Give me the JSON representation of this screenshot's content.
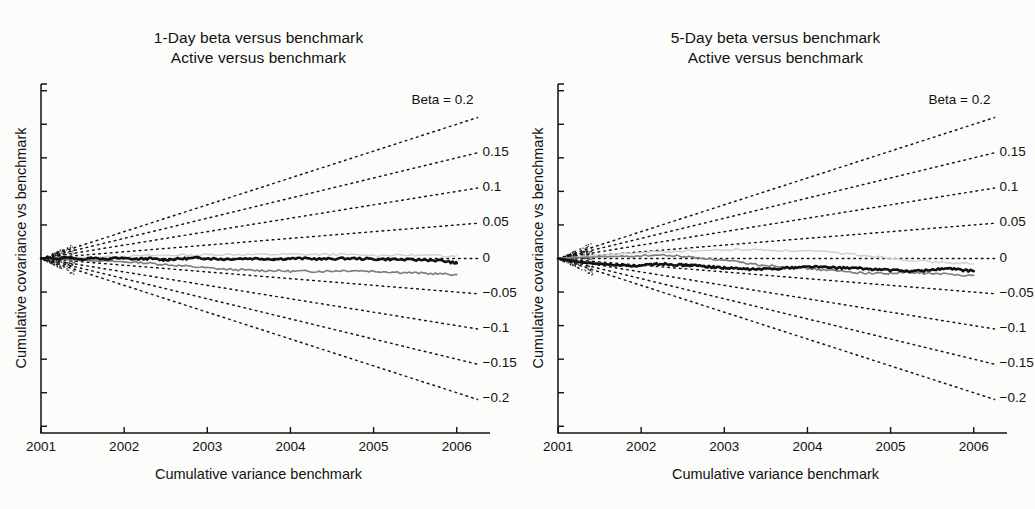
{
  "figure": {
    "background": "#fcfcfa",
    "ink": "#111111"
  },
  "panels": [
    {
      "id": "panel-1day",
      "title_line1": "1-Day beta versus benchmark",
      "title_line2": "Active versus benchmark",
      "ylabel": "Cumulative covariance vs benchmark",
      "xlabel": "Cumulative variance benchmark"
    },
    {
      "id": "panel-5day",
      "title_line1": "5-Day beta versus benchmark",
      "title_line2": "Active versus benchmark",
      "ylabel": "Cumulative covariance vs benchmark",
      "xlabel": "Cumulative variance benchmark"
    }
  ],
  "axis": {
    "xticklabels": [
      "2001",
      "2002",
      "2003",
      "2004",
      "2005",
      "2006"
    ],
    "beta_labels": [
      "Beta = 0.2",
      "0.15",
      "0.1",
      "0.05",
      "0",
      "-0.05",
      "-0.1",
      "-0.15",
      "-0.2"
    ]
  },
  "chart_data": {
    "type": "line",
    "n_panels": 2,
    "xlabel": "Cumulative variance benchmark",
    "ylabel": "Cumulative covariance vs benchmark",
    "xticklabels": [
      "2001",
      "2002",
      "2003",
      "2004",
      "2005",
      "2006"
    ],
    "x": [
      2001,
      2002,
      2003,
      2004,
      2005,
      2006
    ],
    "xlim": [
      2001,
      2006.4
    ],
    "ylim": [
      -0.26,
      0.26
    ],
    "ytick_values_unlabeled": [
      0.25,
      0.2,
      0.15,
      0.1,
      0.05,
      0,
      -0.05,
      -0.1,
      -0.15,
      -0.2,
      -0.25
    ],
    "grid": false,
    "legend": "right-side beta fan labels",
    "reference_fan": {
      "description": "Dotted reference rays emanating from the 2001 origin; each ray has constant slope equal to its beta value, reaching the stated value at 2006.",
      "style": "dotted",
      "betas": [
        0.2,
        0.15,
        0.1,
        0.05,
        0,
        -0.05,
        -0.1,
        -0.15,
        -0.2
      ],
      "labels": [
        "Beta = 0.2",
        "0.15",
        "0.1",
        "0.05",
        "0",
        "-0.05",
        "-0.1",
        "-0.15",
        "-0.2"
      ],
      "end_values": [
        0.2,
        0.15,
        0.1,
        0.05,
        0.0,
        -0.05,
        -0.1,
        -0.15,
        -0.2
      ]
    },
    "panels": [
      {
        "name": "1-Day beta versus benchmark",
        "series": [
          {
            "name": "active-cumulative-covariance-thick-black",
            "color": "#111111",
            "width": 2.6,
            "x": [
              2001.0,
              2001.1,
              2001.2,
              2001.3,
              2001.4,
              2001.5,
              2001.6,
              2001.7,
              2001.8,
              2001.9,
              2002.0,
              2002.15,
              2002.3,
              2002.45,
              2002.6,
              2002.75,
              2002.9,
              2003.05,
              2003.2,
              2003.4,
              2003.6,
              2003.8,
              2004.0,
              2004.2,
              2004.4,
              2004.6,
              2004.8,
              2005.0,
              2005.2,
              2005.4,
              2005.6,
              2005.8,
              2005.95,
              2006.0
            ],
            "y": [
              0.0,
              0.001,
              -0.001,
              0.002,
              0.0,
              -0.002,
              0.001,
              0.0,
              -0.001,
              0.001,
              0.0,
              -0.001,
              0.0,
              -0.002,
              -0.001,
              0.0,
              0.001,
              0.0,
              -0.001,
              0.0,
              0.0,
              -0.001,
              0.0,
              0.0,
              -0.001,
              0.0,
              0.0,
              -0.001,
              -0.001,
              -0.002,
              -0.002,
              -0.003,
              -0.006,
              -0.007
            ]
          },
          {
            "name": "active-cumulative-covariance-gray",
            "color": "#7c7c7c",
            "width": 1.6,
            "x": [
              2001.0,
              2001.2,
              2001.4,
              2001.6,
              2001.8,
              2002.0,
              2002.2,
              2002.4,
              2002.6,
              2002.8,
              2003.0,
              2003.2,
              2003.4,
              2003.6,
              2003.8,
              2004.0,
              2004.2,
              2004.4,
              2004.6,
              2004.8,
              2005.0,
              2005.2,
              2005.4,
              2005.6,
              2005.8,
              2006.0
            ],
            "y": [
              0.0,
              -0.001,
              -0.002,
              -0.003,
              -0.004,
              -0.005,
              -0.006,
              -0.008,
              -0.01,
              -0.012,
              -0.014,
              -0.016,
              -0.017,
              -0.018,
              -0.018,
              -0.019,
              -0.019,
              -0.019,
              -0.018,
              -0.018,
              -0.019,
              -0.02,
              -0.021,
              -0.022,
              -0.023,
              -0.024
            ]
          },
          {
            "name": "active-cumulative-covariance-light-gray",
            "color": "#cfcfcf",
            "width": 1.4,
            "x": [
              2001.0,
              2001.3,
              2001.6,
              2001.9,
              2002.2,
              2002.5,
              2002.8,
              2003.1,
              2003.4,
              2003.7,
              2004.0,
              2004.3,
              2004.6,
              2004.9,
              2005.2,
              2005.5,
              2005.8,
              2006.0
            ],
            "y": [
              0.0,
              0.001,
              0.002,
              0.003,
              0.004,
              0.005,
              0.005,
              0.006,
              0.006,
              0.006,
              0.006,
              0.006,
              0.006,
              0.005,
              0.005,
              0.005,
              0.004,
              0.004
            ]
          }
        ]
      },
      {
        "name": "5-Day beta versus benchmark",
        "series": [
          {
            "name": "active-cumulative-covariance-thick-black",
            "color": "#111111",
            "width": 2.6,
            "x": [
              2001.0,
              2001.1,
              2001.2,
              2001.3,
              2001.4,
              2001.5,
              2001.6,
              2001.7,
              2001.8,
              2001.9,
              2002.0,
              2002.1,
              2002.2,
              2002.3,
              2002.4,
              2002.5,
              2002.6,
              2002.7,
              2002.8,
              2002.9,
              2003.0,
              2003.15,
              2003.3,
              2003.45,
              2003.6,
              2003.75,
              2003.9,
              2004.05,
              2004.2,
              2004.35,
              2004.5,
              2004.65,
              2004.8,
              2004.95,
              2005.1,
              2005.25,
              2005.4,
              2005.55,
              2005.7,
              2005.85,
              2006.0
            ],
            "y": [
              0.0,
              -0.002,
              -0.004,
              -0.006,
              -0.007,
              -0.008,
              -0.009,
              -0.01,
              -0.01,
              -0.011,
              -0.011,
              -0.009,
              -0.008,
              -0.008,
              -0.009,
              -0.01,
              -0.01,
              -0.011,
              -0.012,
              -0.013,
              -0.014,
              -0.015,
              -0.016,
              -0.016,
              -0.015,
              -0.014,
              -0.013,
              -0.012,
              -0.013,
              -0.014,
              -0.014,
              -0.015,
              -0.016,
              -0.017,
              -0.018,
              -0.019,
              -0.018,
              -0.016,
              -0.015,
              -0.017,
              -0.019
            ]
          },
          {
            "name": "active-cumulative-covariance-gray",
            "color": "#7c7c7c",
            "width": 1.6,
            "x": [
              2001.0,
              2001.2,
              2001.4,
              2001.6,
              2001.8,
              2002.0,
              2002.2,
              2002.4,
              2002.6,
              2002.8,
              2003.0,
              2003.2,
              2003.4,
              2003.6,
              2003.8,
              2004.0,
              2004.2,
              2004.4,
              2004.6,
              2004.8,
              2005.0,
              2005.2,
              2005.4,
              2005.6,
              2005.8,
              2006.0
            ],
            "y": [
              0.0,
              0.001,
              0.002,
              0.003,
              0.003,
              0.004,
              0.005,
              0.004,
              0.002,
              0.0,
              -0.003,
              -0.006,
              -0.009,
              -0.011,
              -0.013,
              -0.015,
              -0.017,
              -0.019,
              -0.021,
              -0.022,
              -0.022,
              -0.021,
              -0.022,
              -0.023,
              -0.024,
              -0.025
            ]
          },
          {
            "name": "active-cumulative-covariance-light-gray",
            "color": "#cfcfcf",
            "width": 1.4,
            "x": [
              2001.0,
              2001.3,
              2001.6,
              2001.9,
              2002.2,
              2002.5,
              2002.8,
              2003.1,
              2003.4,
              2003.7,
              2004.0,
              2004.3,
              2004.6,
              2004.9,
              2005.2,
              2005.5,
              2005.8,
              2006.0
            ],
            "y": [
              0.0,
              0.003,
              0.006,
              0.008,
              0.01,
              0.011,
              0.012,
              0.013,
              0.013,
              0.012,
              0.011,
              0.009,
              0.006,
              0.002,
              -0.002,
              -0.005,
              -0.007,
              -0.008
            ]
          }
        ]
      }
    ]
  }
}
